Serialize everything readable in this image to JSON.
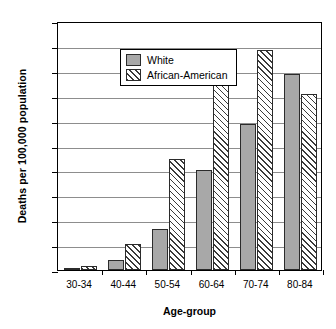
{
  "chart_data": {
    "type": "bar",
    "title": "",
    "xlabel": "Age-group",
    "ylabel": "Deaths per 100,000 population",
    "categories": [
      "30-34",
      "40-44",
      "50-54",
      "60-64",
      "70-74",
      "80-84"
    ],
    "series": [
      {
        "name": "White",
        "values": [
          0.2,
          0.8,
          3.3,
          8.0,
          11.7,
          15.75
        ]
      },
      {
        "name": "African-American",
        "values": [
          0.3,
          2.1,
          8.9,
          15.2,
          17.7,
          14.1
        ]
      }
    ],
    "ylim": [
      0,
      20
    ],
    "ytick_step": 2,
    "yticks": [
      0,
      2,
      4,
      6,
      8,
      10,
      12,
      14,
      16,
      18,
      20
    ],
    "ytick_labels": [
      "0",
      "2",
      "4",
      "6",
      "8",
      "10",
      "12",
      "14",
      "16",
      "18",
      "20"
    ],
    "grid": "horizontal",
    "legend_position": "top-left",
    "colors": {
      "white_series": "#a8a8a8",
      "african_american_series": "#ffffff",
      "hatch": "#3a3a3a",
      "gridline": "#8d8d8d",
      "axis": "#000000",
      "background": "#ffffff"
    }
  }
}
